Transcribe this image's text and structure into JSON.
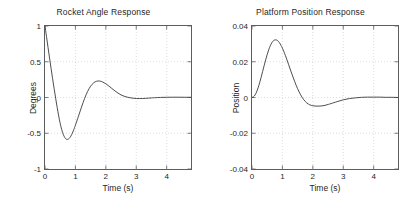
{
  "figure": {
    "background": "#ffffff",
    "axis_color": "#5d5d5d",
    "line_color": "#3a3a3a",
    "grid_color": "#c8c8c8",
    "width": 414,
    "height": 208
  },
  "chart_data": [
    {
      "type": "line",
      "name": "rocket-angle-response",
      "title": "Rocket Angle Response",
      "xlabel": "Time (s)",
      "ylabel": "Degrees",
      "xlim": [
        0,
        4.8
      ],
      "ylim": [
        -1,
        1
      ],
      "xticks": [
        0,
        1,
        2,
        3,
        4
      ],
      "xticklabels": [
        "0",
        "1",
        "2",
        "3",
        "4"
      ],
      "yticks": [
        -1,
        -0.5,
        0,
        0.5,
        1
      ],
      "yticklabels": [
        "-1",
        "-0.5",
        "0",
        "0.5",
        "1"
      ],
      "grid": true,
      "legend": null,
      "series": [
        {
          "name": "angle",
          "x": [
            0.0,
            0.05,
            0.1,
            0.15,
            0.2,
            0.25,
            0.3,
            0.35,
            0.4,
            0.45,
            0.5,
            0.55,
            0.6,
            0.65,
            0.7,
            0.75,
            0.8,
            0.85,
            0.9,
            0.95,
            1.0,
            1.1,
            1.2,
            1.3,
            1.4,
            1.5,
            1.6,
            1.7,
            1.8,
            1.9,
            2.0,
            2.1,
            2.2,
            2.3,
            2.4,
            2.5,
            2.6,
            2.7,
            2.8,
            2.9,
            3.0,
            3.1,
            3.2,
            3.3,
            3.4,
            3.5,
            3.6,
            3.8,
            4.0,
            4.2,
            4.4,
            4.6,
            4.8
          ],
          "y": [
            1.0,
            0.85,
            0.7,
            0.552,
            0.406,
            0.263,
            0.124,
            -0.01,
            -0.138,
            -0.258,
            -0.364,
            -0.45,
            -0.515,
            -0.56,
            -0.583,
            -0.585,
            -0.57,
            -0.54,
            -0.498,
            -0.446,
            -0.388,
            -0.262,
            -0.134,
            -0.016,
            0.084,
            0.158,
            0.205,
            0.228,
            0.23,
            0.216,
            0.192,
            0.16,
            0.126,
            0.092,
            0.062,
            0.036,
            0.018,
            0.005,
            -0.004,
            -0.01,
            -0.014,
            -0.015,
            -0.014,
            -0.012,
            -0.009,
            -0.006,
            -0.003,
            0.001,
            0.003,
            0.004,
            0.004,
            0.003,
            0.003
          ],
          "peak_undershoot": -0.585,
          "peak_undershoot_time": 0.75,
          "peak_overshoot": 0.23,
          "peak_overshoot_time": 1.8,
          "initial_value": 1.0,
          "final_value": 0.0
        }
      ]
    },
    {
      "type": "line",
      "name": "platform-position-response",
      "title": "Platform Position Response",
      "xlabel": "Time (s)",
      "ylabel": "Position",
      "xlim": [
        0,
        4.8
      ],
      "ylim": [
        -0.04,
        0.04
      ],
      "xticks": [
        0,
        1,
        2,
        3,
        4
      ],
      "xticklabels": [
        "0",
        "1",
        "2",
        "3",
        "4"
      ],
      "yticks": [
        -0.04,
        -0.02,
        0,
        0.02,
        0.04
      ],
      "yticklabels": [
        "-0.04",
        "-0.02",
        "0",
        "0.02",
        "0.04"
      ],
      "grid": true,
      "legend": null,
      "series": [
        {
          "name": "position",
          "x": [
            0.0,
            0.05,
            0.1,
            0.15,
            0.2,
            0.25,
            0.3,
            0.35,
            0.4,
            0.45,
            0.5,
            0.55,
            0.6,
            0.65,
            0.7,
            0.75,
            0.8,
            0.85,
            0.9,
            0.95,
            1.0,
            1.1,
            1.2,
            1.3,
            1.4,
            1.5,
            1.6,
            1.7,
            1.8,
            1.9,
            2.0,
            2.1,
            2.2,
            2.3,
            2.4,
            2.5,
            2.6,
            2.8,
            3.0,
            3.2,
            3.4,
            3.6,
            3.8,
            4.0,
            4.2,
            4.4,
            4.6,
            4.8
          ],
          "y": [
            0.0,
            0.0004,
            0.0014,
            0.0031,
            0.0054,
            0.0082,
            0.0113,
            0.0146,
            0.0179,
            0.0211,
            0.0241,
            0.0267,
            0.0289,
            0.0306,
            0.0317,
            0.0322,
            0.0322,
            0.0317,
            0.0307,
            0.0293,
            0.0276,
            0.0234,
            0.0186,
            0.0137,
            0.0091,
            0.0049,
            0.0015,
            -0.0012,
            -0.003,
            -0.0041,
            -0.0046,
            -0.0048,
            -0.0048,
            -0.0047,
            -0.0044,
            -0.0039,
            -0.0034,
            -0.0023,
            -0.0013,
            -0.0006,
            -0.0002,
            0.0001,
            0.0002,
            0.0002,
            0.0002,
            0.0001,
            0.0001,
            0.0
          ],
          "peak_overshoot": 0.0322,
          "peak_overshoot_time": 0.78,
          "peak_undershoot": -0.0048,
          "peak_undershoot_time": 2.2,
          "initial_value": 0.0,
          "final_value": 0.0
        }
      ]
    }
  ]
}
